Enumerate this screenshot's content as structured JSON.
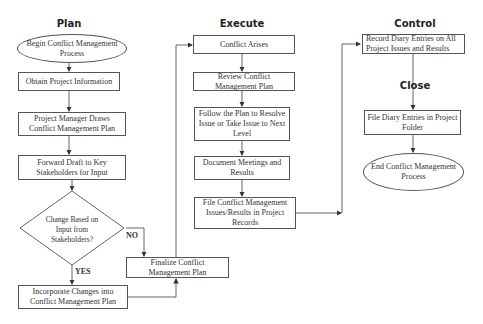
{
  "lanes": {
    "plan": "Plan",
    "execute": "Execute",
    "control": "Control",
    "close": "Close"
  },
  "nodes": {
    "begin": "Begin Conflict Management Process",
    "obtain": "Obtain Project Information",
    "pm_draws": "Project Manager Draws Conflict Management Plan",
    "forward": "Forward Draft to Key Stakeholders for Input",
    "decision": "Change Based on Input from Stakeholders?",
    "incorporate": "Incorporate Changes into Conflict Management Plan",
    "finalize": "Finalize Conflict Management Plan",
    "conflict_arises": "Conflict Arises",
    "review": "Review Conflict Management Plan",
    "follow": "Follow the Plan to Resolve Issue or Take Issue to Next Level",
    "document": "Document Meetings and Results",
    "file_conflict": "File Conflict Management Issues/Results in Project Records",
    "record_diary": "Record Diary Entries on All Project Issues and Results",
    "file_diary": "File Diary Entries in Project Folder",
    "end": "End Conflict Management Process"
  },
  "edge_labels": {
    "no": "NO",
    "yes": "YES"
  },
  "colors": {
    "line": "#444444",
    "border": "#555555",
    "text": "#333333"
  }
}
